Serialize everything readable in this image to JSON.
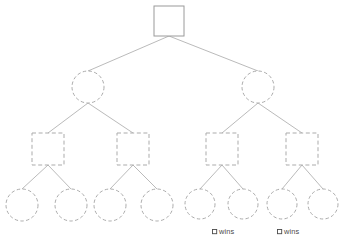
{
  "diagram": {
    "background_color": "#ffffff",
    "stroke_color": "#ababab",
    "edge_color": "#a8a8a8",
    "text_color": "#4a4a4a",
    "levels": [
      {
        "level": 0,
        "shape": "square",
        "line_style": "solid",
        "count": 1,
        "nodes": [
          {
            "id": "root",
            "cx": 169,
            "cy": 21,
            "size": 30
          }
        ]
      },
      {
        "level": 1,
        "shape": "circle",
        "line_style": "dashed",
        "count": 2,
        "nodes": [
          {
            "id": "n1",
            "cx": 88,
            "cy": 87,
            "r": 16
          },
          {
            "id": "n2",
            "cx": 258,
            "cy": 87,
            "r": 16
          }
        ]
      },
      {
        "level": 2,
        "shape": "square",
        "line_style": "dashed",
        "count": 4,
        "nodes": [
          {
            "id": "m1",
            "cx": 48,
            "cy": 149,
            "size": 32
          },
          {
            "id": "m2",
            "cx": 133,
            "cy": 149,
            "size": 32
          },
          {
            "id": "m3",
            "cx": 222,
            "cy": 149,
            "size": 32
          },
          {
            "id": "m4",
            "cx": 302,
            "cy": 149,
            "size": 32
          }
        ]
      },
      {
        "level": 3,
        "shape": "circle",
        "line_style": "dashed",
        "count": 8,
        "nodes": [
          {
            "id": "l1",
            "cx": 22,
            "cy": 205,
            "r": 16
          },
          {
            "id": "l2",
            "cx": 71,
            "cy": 205,
            "r": 16
          },
          {
            "id": "l3",
            "cx": 110,
            "cy": 205,
            "r": 16
          },
          {
            "id": "l4",
            "cx": 157,
            "cy": 205,
            "r": 16
          },
          {
            "id": "l5",
            "cx": 200,
            "cy": 204,
            "r": 15
          },
          {
            "id": "l6",
            "cx": 243,
            "cy": 204,
            "r": 15
          },
          {
            "id": "l7",
            "cx": 282,
            "cy": 204,
            "r": 15
          },
          {
            "id": "l8",
            "cx": 323,
            "cy": 204,
            "r": 15
          }
        ]
      }
    ],
    "edges": [
      {
        "from": "root",
        "to": "n1",
        "x1": 169,
        "y1": 36,
        "x2": 88,
        "y2": 71
      },
      {
        "from": "root",
        "to": "n2",
        "x1": 169,
        "y1": 36,
        "x2": 258,
        "y2": 71
      },
      {
        "from": "n1",
        "to": "m1",
        "x1": 88,
        "y1": 103,
        "x2": 48,
        "y2": 133
      },
      {
        "from": "n1",
        "to": "m2",
        "x1": 88,
        "y1": 103,
        "x2": 133,
        "y2": 133
      },
      {
        "from": "n2",
        "to": "m3",
        "x1": 258,
        "y1": 103,
        "x2": 222,
        "y2": 133
      },
      {
        "from": "n2",
        "to": "m4",
        "x1": 258,
        "y1": 103,
        "x2": 302,
        "y2": 133
      },
      {
        "from": "m1",
        "to": "l1",
        "x1": 48,
        "y1": 165,
        "x2": 22,
        "y2": 189
      },
      {
        "from": "m1",
        "to": "l2",
        "x1": 48,
        "y1": 165,
        "x2": 71,
        "y2": 189
      },
      {
        "from": "m2",
        "to": "l3",
        "x1": 133,
        "y1": 165,
        "x2": 110,
        "y2": 189
      },
      {
        "from": "m2",
        "to": "l4",
        "x1": 133,
        "y1": 165,
        "x2": 157,
        "y2": 189
      },
      {
        "from": "m3",
        "to": "l5",
        "x1": 222,
        "y1": 165,
        "x2": 200,
        "y2": 189
      },
      {
        "from": "m3",
        "to": "l6",
        "x1": 222,
        "y1": 165,
        "x2": 243,
        "y2": 189
      },
      {
        "from": "m4",
        "to": "l7",
        "x1": 302,
        "y1": 165,
        "x2": 282,
        "y2": 189
      },
      {
        "from": "m4",
        "to": "l8",
        "x1": 302,
        "y1": 165,
        "x2": 323,
        "y2": 189
      }
    ],
    "annotations": [
      {
        "id": "win-label-1",
        "text": "wins",
        "glyph": "square-glyph",
        "x": 213,
        "y": 234,
        "glyph_x": 214,
        "glyph_y": 229
      },
      {
        "id": "win-label-2",
        "text": "wins",
        "glyph": "square-glyph",
        "x": 285,
        "y": 234,
        "glyph_x": 278,
        "glyph_y": 229
      }
    ]
  }
}
